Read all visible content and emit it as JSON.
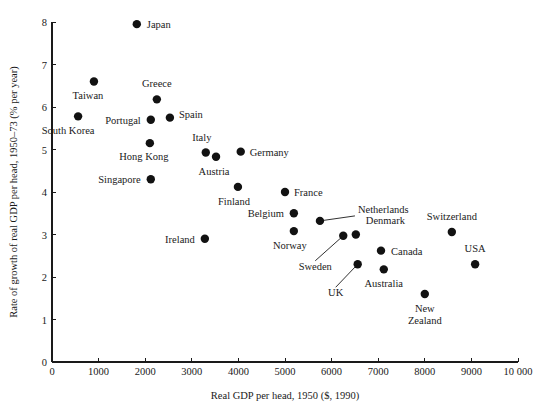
{
  "chart_data": {
    "type": "scatter",
    "title": "",
    "xlabel": "Real GDP per head, 1950 ($, 1990)",
    "ylabel": "Rate of growth of real GDP per head, 1950–73 (% per year)",
    "xlim": [
      0,
      10000
    ],
    "ylim": [
      0,
      8
    ],
    "grid": false,
    "legend": "none",
    "xticks": [
      "0",
      "1000",
      "2000",
      "3000",
      "4000",
      "5000",
      "6000",
      "7000",
      "8000",
      "9000",
      "10 000"
    ],
    "xtick_values": [
      0,
      1000,
      2000,
      3000,
      4000,
      5000,
      6000,
      7000,
      8000,
      9000,
      10000
    ],
    "yticks": [
      "0",
      "1",
      "2",
      "3",
      "4",
      "5",
      "6",
      "7",
      "8"
    ],
    "ytick_values": [
      0,
      1,
      2,
      3,
      4,
      5,
      6,
      7,
      8
    ],
    "points": [
      {
        "name": "Japan",
        "x": 1820,
        "y": 7.95,
        "label_side": "right",
        "dx": 10,
        "dy": 4,
        "leader": false
      },
      {
        "name": "Taiwan",
        "x": 900,
        "y": 6.6,
        "label_side": "below",
        "dx": -6,
        "dy": 17,
        "leader": false
      },
      {
        "name": "Greece",
        "x": 2250,
        "y": 6.18,
        "label_side": "above",
        "dx": 0,
        "dy": -12,
        "leader": false
      },
      {
        "name": "Portugal",
        "x": 2120,
        "y": 5.7,
        "label_side": "left",
        "dx": -10,
        "dy": 4,
        "leader": false
      },
      {
        "name": "Spain",
        "x": 2530,
        "y": 5.75,
        "label_side": "right",
        "dx": 9,
        "dy": 0,
        "leader": false
      },
      {
        "name": "South Korea",
        "x": 560,
        "y": 5.78,
        "label_side": "below",
        "dx": -10,
        "dy": 18,
        "leader": false
      },
      {
        "name": "Hong Kong",
        "x": 2100,
        "y": 5.15,
        "label_side": "below",
        "dx": -6,
        "dy": 17,
        "leader": false
      },
      {
        "name": "Singapore",
        "x": 2120,
        "y": 4.3,
        "label_side": "left",
        "dx": -10,
        "dy": 4,
        "leader": false
      },
      {
        "name": "Italy",
        "x": 3300,
        "y": 4.93,
        "label_side": "above",
        "dx": -4,
        "dy": -11,
        "leader": false
      },
      {
        "name": "Austria",
        "x": 3520,
        "y": 4.83,
        "label_side": "below",
        "dx": -2,
        "dy": 18,
        "leader": false
      },
      {
        "name": "Germany",
        "x": 4050,
        "y": 4.95,
        "label_side": "right",
        "dx": 9,
        "dy": 4,
        "leader": false
      },
      {
        "name": "Finland",
        "x": 3990,
        "y": 4.12,
        "label_side": "below",
        "dx": -4,
        "dy": 18,
        "leader": false
      },
      {
        "name": "Ireland",
        "x": 3280,
        "y": 2.9,
        "label_side": "left",
        "dx": -10,
        "dy": 4,
        "leader": false
      },
      {
        "name": "France",
        "x": 5000,
        "y": 4.0,
        "label_side": "right",
        "dx": 9,
        "dy": 4,
        "leader": false
      },
      {
        "name": "Belgium",
        "x": 5190,
        "y": 3.5,
        "label_side": "left",
        "dx": -10,
        "dy": 4,
        "leader": false
      },
      {
        "name": "Norway",
        "x": 5190,
        "y": 3.08,
        "label_side": "below",
        "dx": -4,
        "dy": 18,
        "leader": false
      },
      {
        "name": "Netherlands",
        "x": 5750,
        "y": 3.32,
        "label_side": "right",
        "dx": 38,
        "dy": -8,
        "leader": true
      },
      {
        "name": "Denmark",
        "x": 6520,
        "y": 3.0,
        "label_side": "right",
        "dx": 10,
        "dy": -11,
        "leader": false
      },
      {
        "name": "Sweden",
        "x": 6250,
        "y": 2.97,
        "label_side": "below",
        "dx": -28,
        "dy": 34,
        "leader": true
      },
      {
        "name": "UK",
        "x": 6560,
        "y": 2.3,
        "label_side": "below",
        "dx": -22,
        "dy": 32,
        "leader": true
      },
      {
        "name": "Australia",
        "x": 7120,
        "y": 2.18,
        "label_side": "below",
        "dx": 0,
        "dy": 18,
        "leader": false
      },
      {
        "name": "Canada",
        "x": 7060,
        "y": 2.62,
        "label_side": "right",
        "dx": 10,
        "dy": 4,
        "leader": false
      },
      {
        "name": "New Zealand",
        "x": 8000,
        "y": 1.6,
        "label_side": "below",
        "dx": 0,
        "dy": 18,
        "leader": false
      },
      {
        "name": "Switzerland",
        "x": 8580,
        "y": 3.06,
        "label_side": "above",
        "dx": 0,
        "dy": -12,
        "leader": false
      },
      {
        "name": "USA",
        "x": 9080,
        "y": 2.3,
        "label_side": "above",
        "dx": 0,
        "dy": -12,
        "leader": false
      }
    ]
  },
  "colors": {
    "marker": "#121212",
    "axis": "#1a1a1a",
    "background": "#ffffff"
  }
}
